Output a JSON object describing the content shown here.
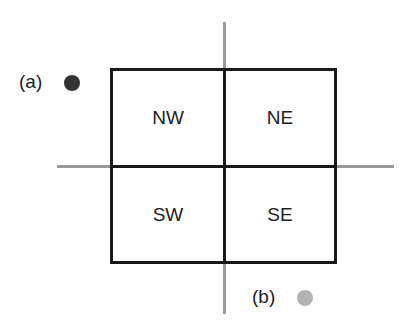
{
  "diagram": {
    "quadrants": [
      {
        "id": "nw",
        "label": "NW"
      },
      {
        "id": "ne",
        "label": "NE"
      },
      {
        "id": "sw",
        "label": "SW"
      },
      {
        "id": "se",
        "label": "SE"
      }
    ],
    "points": [
      {
        "label": "(a)",
        "color": "#333333",
        "position": "outside top-left, beside NW"
      },
      {
        "label": "(b)",
        "color": "#b3b3b3",
        "position": "outside bottom-right, below SE"
      }
    ],
    "colors": {
      "axes": "#9a9a9a",
      "border": "#1a1a1a"
    }
  }
}
